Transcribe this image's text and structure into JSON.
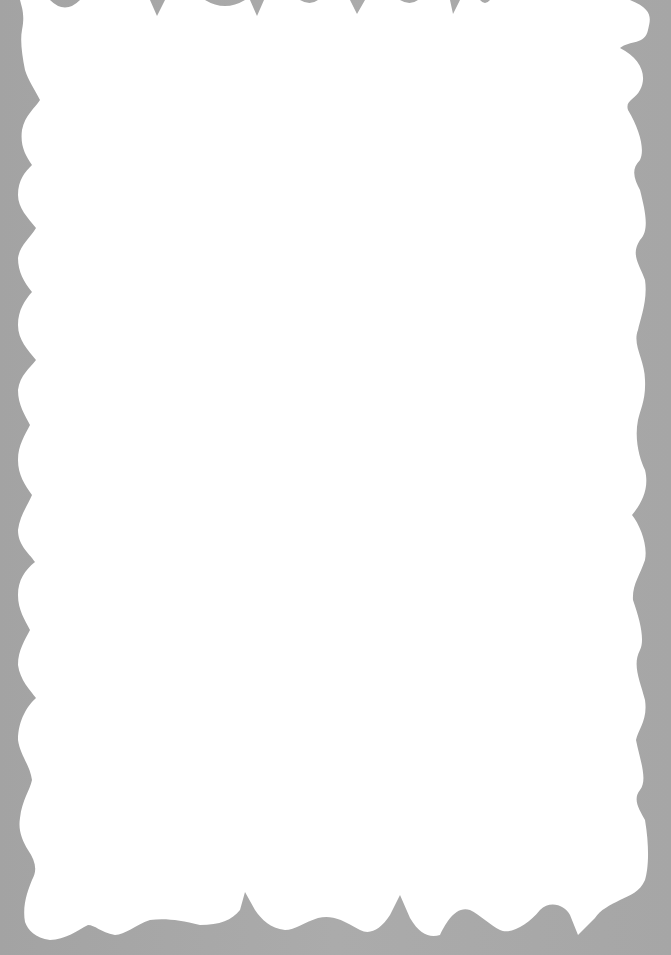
{
  "page": {
    "type": "blank-scalloped-card",
    "background_color": "#a8a8a8",
    "card_color": "#ffffff",
    "edge_style": "wavy-scalloped",
    "text_content": ""
  }
}
